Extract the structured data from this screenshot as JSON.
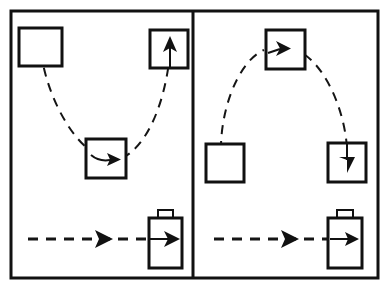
{
  "figure": {
    "background_color": "#ffffff",
    "ink_color": "#111111",
    "width": 389,
    "height": 288,
    "outer_frame": {
      "x": 11,
      "y": 11,
      "width": 367,
      "height": 267,
      "stroke_width": 3
    },
    "divider": {
      "x": 193,
      "y_top": 11,
      "y_bottom": 278,
      "stroke_width": 3
    }
  },
  "panels": [
    {
      "id": "left-panel",
      "name": "left-panel",
      "label": "Left panel: valley trajectory",
      "trajectory": {
        "name": "valley-dashed-curve",
        "shape": "u-curve",
        "description": "Dashed curve descending from top-left box, through middle box, rising to top-right box",
        "start": {
          "x": 41,
          "y": 52
        },
        "end": {
          "x": 170,
          "y": 48
        },
        "lowest_point": {
          "x": 106,
          "y": 160
        },
        "dash_pattern": "9 7",
        "stroke_width": 2
      },
      "boxes": [
        {
          "name": "box-top-left",
          "x": 19,
          "y": 28,
          "width": 43,
          "height": 38,
          "stroke_width": 3,
          "arrow": null
        },
        {
          "name": "box-middle",
          "x": 86,
          "y": 139,
          "width": 40,
          "height": 39,
          "stroke_width": 3,
          "arrow": "right"
        },
        {
          "name": "box-top-right",
          "x": 150,
          "y": 30,
          "width": 38,
          "height": 38,
          "stroke_width": 3,
          "arrow": "up"
        }
      ],
      "bottom_row": {
        "name": "bottom-dashed-arrow-row",
        "dash_line": {
          "x_start": 28,
          "x_end": 178,
          "y": 239,
          "dash_pattern": "10 8",
          "stroke_width": 3
        },
        "mid_arrowhead": {
          "x": 106,
          "y": 239,
          "direction": "right"
        },
        "target_arrow": {
          "x_start": 150,
          "x_end": 178,
          "y": 239,
          "direction": "right"
        },
        "bag": {
          "name": "bag-icon",
          "body": {
            "x": 149,
            "y": 218,
            "width": 33,
            "height": 50,
            "stroke_width": 3
          },
          "handle": {
            "x": 158,
            "y": 210,
            "width": 15,
            "height": 8,
            "stroke_width": 2
          }
        }
      }
    },
    {
      "id": "right-panel",
      "name": "right-panel",
      "label": "Right panel: arch trajectory",
      "trajectory": {
        "name": "arch-dashed-curve",
        "shape": "inverted-u-curve",
        "description": "Dashed curve rising from lower-left box, over the top box, descending into the lower-right box",
        "start": {
          "x": 222,
          "y": 166
        },
        "end": {
          "x": 347,
          "y": 160
        },
        "highest_point": {
          "x": 286,
          "y": 47
        },
        "dash_pattern": "9 7",
        "stroke_width": 2
      },
      "boxes": [
        {
          "name": "box-top-center",
          "x": 266,
          "y": 30,
          "width": 39,
          "height": 39,
          "stroke_width": 3,
          "arrow": "right"
        },
        {
          "name": "box-lower-left",
          "x": 206,
          "y": 144,
          "width": 38,
          "height": 38,
          "stroke_width": 3,
          "arrow": null
        },
        {
          "name": "box-lower-right",
          "x": 328,
          "y": 143,
          "width": 38,
          "height": 39,
          "stroke_width": 3,
          "arrow": "down"
        }
      ],
      "bottom_row": {
        "name": "bottom-dashed-arrow-row",
        "dash_line": {
          "x_start": 214,
          "x_end": 362,
          "y": 239,
          "dash_pattern": "10 8",
          "stroke_width": 3
        },
        "mid_arrowhead": {
          "x": 291,
          "y": 239,
          "direction": "right"
        },
        "target_arrow": {
          "x_start": 332,
          "x_end": 362,
          "y": 239,
          "direction": "right"
        },
        "bag": {
          "name": "bag-icon",
          "body": {
            "x": 328,
            "y": 218,
            "width": 34,
            "height": 50,
            "stroke_width": 3
          },
          "handle": {
            "x": 337,
            "y": 210,
            "width": 16,
            "height": 8,
            "stroke_width": 2
          }
        }
      }
    }
  ],
  "legend": {
    "dashed_line_meaning": "motion path",
    "solid_arrow_meaning": "direction of travel",
    "box_meaning": "waypoint",
    "bag_meaning": "goal object"
  }
}
